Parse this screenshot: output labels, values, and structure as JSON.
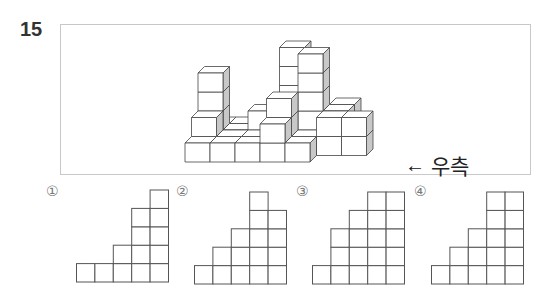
{
  "question": {
    "number": "15",
    "direction_label": "우측",
    "direction_arrow": "🡐"
  },
  "options": [
    {
      "label": "①",
      "column_heights": [
        1,
        1,
        2,
        4,
        5
      ]
    },
    {
      "label": "②",
      "column_heights": [
        1,
        2,
        3,
        5,
        4
      ]
    },
    {
      "label": "③",
      "column_heights": [
        1,
        3,
        4,
        5,
        5
      ]
    },
    {
      "label": "④",
      "column_heights": [
        1,
        2,
        3,
        5,
        5
      ]
    }
  ],
  "colors": {
    "cube_front": "#ffffff",
    "cube_top": "#ffffff",
    "cube_side": "#c8c8c8",
    "line": "#444444",
    "grid_line": "#555555"
  }
}
